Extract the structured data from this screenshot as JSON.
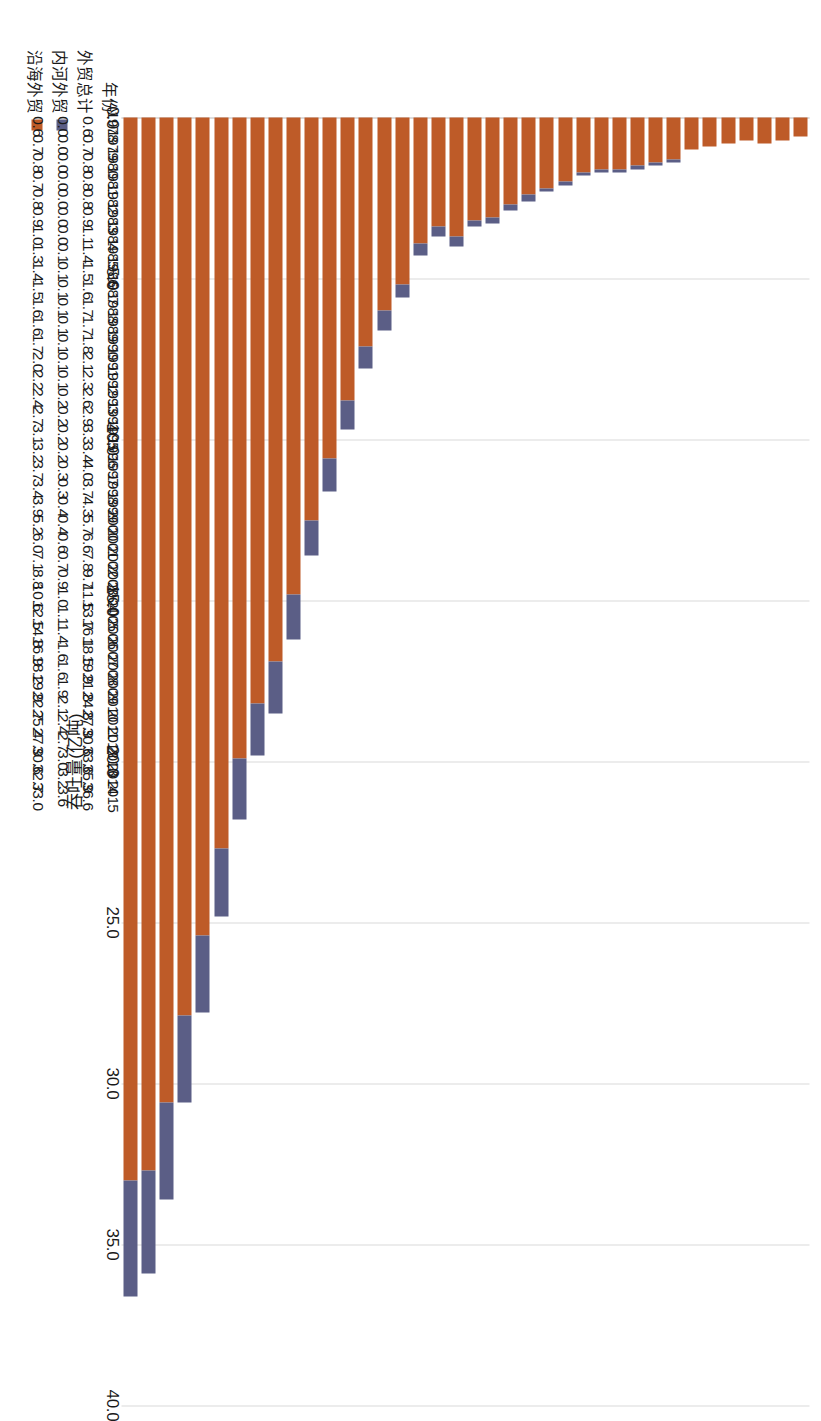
{
  "chart_data": {
    "type": "bar",
    "orientation": "vertical-stacked",
    "title": "",
    "xlabel": "",
    "ylabel": "吞吐量(亿吨)",
    "ylim": [
      0,
      40
    ],
    "yticks": [
      "0.0",
      "5.0",
      "10.0",
      "15.0",
      "20.0",
      "25.0",
      "30.0",
      "35.0",
      "40.0"
    ],
    "ytick_values": [
      0,
      5,
      10,
      15,
      20,
      25,
      30,
      35,
      40
    ],
    "grid": true,
    "legend_position": "bottom-table",
    "categories": [
      "1978",
      "1979",
      "1980",
      "1981",
      "1982",
      "1983",
      "1984",
      "1985",
      "1986",
      "1987",
      "1988",
      "1989",
      "1990",
      "1991",
      "1992",
      "1993",
      "1994",
      "1995",
      "1996",
      "1997",
      "1998",
      "1999",
      "2000",
      "2001",
      "2002",
      "2003",
      "2004",
      "2005",
      "2006",
      "2007",
      "2008",
      "2009",
      "2010",
      "2011",
      "2012",
      "2013",
      "2014",
      "2015"
    ],
    "series": [
      {
        "name": "沿海外贸",
        "color": "#be5b28",
        "values": [
          0.6,
          0.7,
          0.8,
          0.7,
          0.8,
          0.9,
          1.0,
          1.3,
          1.4,
          1.5,
          1.6,
          1.6,
          1.7,
          2.0,
          2.2,
          2.4,
          2.7,
          3.1,
          3.2,
          3.7,
          3.4,
          3.9,
          5.2,
          6.0,
          7.1,
          8.8,
          10.6,
          12.5,
          14.8,
          16.9,
          18.2,
          19.9,
          22.7,
          25.4,
          27.9,
          30.6,
          32.7,
          33.0
        ]
      },
      {
        "name": "内河外贸",
        "color": "#5b5e86",
        "values": [
          0.0,
          0.0,
          0.0,
          0.0,
          0.0,
          0.0,
          0.0,
          0.1,
          0.1,
          0.1,
          0.1,
          0.1,
          0.1,
          0.1,
          0.1,
          0.2,
          0.2,
          0.2,
          0.2,
          0.3,
          0.3,
          0.4,
          0.4,
          0.6,
          0.7,
          0.9,
          1.0,
          1.1,
          1.4,
          1.6,
          1.6,
          1.9,
          2.1,
          2.4,
          2.7,
          3.0,
          3.2,
          3.6
        ]
      }
    ],
    "totals": {
      "name": "外贸总计",
      "values": [
        0.6,
        0.7,
        0.8,
        0.8,
        0.8,
        0.9,
        1.1,
        1.4,
        1.5,
        1.6,
        1.7,
        1.7,
        1.8,
        2.1,
        2.3,
        2.6,
        2.9,
        3.3,
        3.4,
        4.0,
        3.7,
        4.3,
        5.7,
        6.6,
        7.8,
        9.7,
        11.5,
        13.7,
        16.1,
        18.5,
        19.9,
        21.8,
        24.8,
        27.9,
        30.6,
        33.6,
        35.9,
        36.6
      ]
    }
  },
  "table": {
    "row_labels": {
      "year": "年份",
      "total": "外贸总计",
      "inland": "内河外贸",
      "coastal": "沿海外贸"
    },
    "years": [
      "1978",
      "1979",
      "1980",
      "1981",
      "1982",
      "1983",
      "1984",
      "1985",
      "1986",
      "1987",
      "1988",
      "1989",
      "1990",
      "1991",
      "1992",
      "1993",
      "1994",
      "1995",
      "1996",
      "1997",
      "1998",
      "1999",
      "2000",
      "2001",
      "2002",
      "2003",
      "2004",
      "2005",
      "2006",
      "2007",
      "2008",
      "2009",
      "2010",
      "2011",
      "2012",
      "2013",
      "2014",
      "2015"
    ],
    "total": [
      "0.6",
      "0.7",
      "0.8",
      "0.8",
      "0.8",
      "0.9",
      "1.1",
      "1.4",
      "1.5",
      "1.6",
      "1.7",
      "1.7",
      "1.8",
      "2.1",
      "2.3",
      "2.6",
      "2.9",
      "3.3",
      "3.4",
      "4.0",
      "3.7",
      "4.3",
      "5.7",
      "6.6",
      "7.8",
      "9.7",
      "11.5",
      "13.7",
      "16.1",
      "18.5",
      "19.9",
      "21.8",
      "24.8",
      "27.9",
      "30.6",
      "33.6",
      "35.9",
      "36.6"
    ],
    "inland": [
      "0.0",
      "0.0",
      "0.0",
      "0.0",
      "0.0",
      "0.0",
      "0.0",
      "0.1",
      "0.1",
      "0.1",
      "0.1",
      "0.1",
      "0.1",
      "0.1",
      "0.1",
      "0.2",
      "0.2",
      "0.2",
      "0.2",
      "0.3",
      "0.3",
      "0.4",
      "0.4",
      "0.6",
      "0.7",
      "0.9",
      "1.0",
      "1.1",
      "1.4",
      "1.6",
      "1.6",
      "1.9",
      "2.1",
      "2.4",
      "2.7",
      "3.0",
      "3.2",
      "3.6"
    ],
    "coastal": [
      "0.6",
      "0.7",
      "0.8",
      "0.7",
      "0.8",
      "0.9",
      "1.0",
      "1.3",
      "1.4",
      "1.5",
      "1.6",
      "1.6",
      "1.7",
      "2.0",
      "2.2",
      "2.4",
      "2.7",
      "3.1",
      "3.2",
      "3.7",
      "3.4",
      "3.9",
      "5.2",
      "6.0",
      "7.1",
      "8.8",
      "10.6",
      "12.5",
      "14.8",
      "16.9",
      "18.2",
      "19.9",
      "22.7",
      "25.4",
      "27.9",
      "30.6",
      "32.7",
      "33.0"
    ]
  },
  "colors": {
    "inland": "#5b5e86",
    "coastal": "#be5b28",
    "grid": "#d9d9d9",
    "text": "#1a1a1a"
  }
}
